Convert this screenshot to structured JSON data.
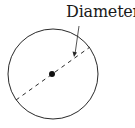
{
  "diagram": {
    "label": "Diameter",
    "stroke_color": "#2a2a2a",
    "circle": {
      "cx": 53,
      "cy": 74,
      "r": 45
    },
    "center_dot": {
      "cx": 52,
      "cy": 74,
      "r": 3
    },
    "diameter_line": {
      "x1": 16,
      "y1": 100,
      "x2": 90,
      "y2": 47
    },
    "arrow": {
      "x1": 79,
      "y1": 26,
      "x2": 74,
      "y2": 56
    }
  }
}
